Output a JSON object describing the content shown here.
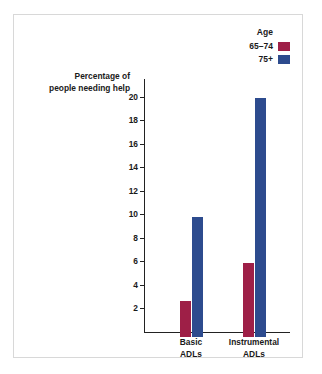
{
  "chart_data": {
    "type": "bar",
    "title": "",
    "xlabel": "",
    "ylabel": "Percentage of people needing help",
    "ylabel_lines": [
      "Percentage of",
      "people needing help"
    ],
    "categories": [
      "Basic ADLs",
      "Instrumental ADLs"
    ],
    "category_lines": [
      [
        "Basic",
        "ADLs"
      ],
      [
        "Instrumental",
        "ADLs"
      ]
    ],
    "series": [
      {
        "name": "65–74",
        "color": "#9e1f47",
        "values": [
          3.1,
          6.3
        ]
      },
      {
        "name": "75+",
        "color": "#2d4b8e",
        "values": [
          10.2,
          20.3
        ]
      }
    ],
    "ylim": [
      0,
      21.5
    ],
    "yticks": [
      2,
      4,
      6,
      8,
      10,
      12,
      14,
      16,
      18,
      20
    ],
    "ytick_labels": [
      "2",
      "4",
      "6",
      "8",
      "10",
      "12",
      "14",
      "16",
      "18",
      "20"
    ],
    "grid": false,
    "legend": {
      "title": "Age",
      "position": "top-right",
      "entries": [
        "65–74",
        "75+"
      ]
    }
  },
  "legend": {
    "title": "Age",
    "items": [
      {
        "label": "65–74",
        "color": "#9e1f47"
      },
      {
        "label": "75+",
        "color": "#2d4b8e"
      }
    ]
  },
  "axes": {
    "y_title_line1": "Percentage of",
    "y_title_line2": "people needing help"
  }
}
